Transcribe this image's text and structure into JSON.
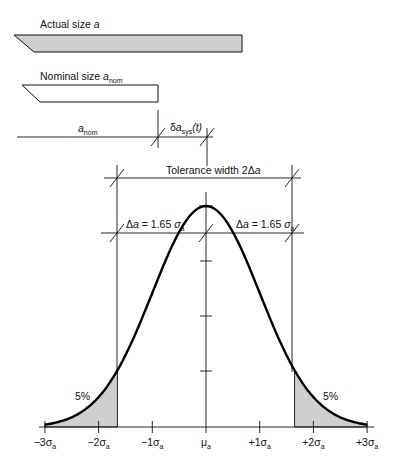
{
  "labels": {
    "actual_size": "Actual size ",
    "actual_size_var": "a",
    "nominal_size": "Nominal size ",
    "nominal_size_var": "a",
    "nominal_size_sub": "nom",
    "a_nom_var": "a",
    "a_nom_sub": "nom",
    "delta_sys_prefix": "δ",
    "delta_sys_var": "a",
    "delta_sys_sub": "sys",
    "delta_sys_suffix": "(t)",
    "tolerance_width": "Tolerance width 2Δ",
    "tolerance_width_var": "a",
    "delta_left_prefix": "Δ",
    "delta_left_var": "a",
    "delta_left_eq": " = 1.65 ",
    "delta_left_sigma": "σ",
    "delta_left_sub": "a",
    "delta_right_prefix": "Δ",
    "delta_right_var": "a",
    "delta_right_eq": " = 1.65 ",
    "delta_right_sigma": "σ",
    "delta_right_sub": "a",
    "tail_left_pct": "5%",
    "tail_right_pct": "5%"
  },
  "axis": {
    "ticks": [
      {
        "main": "−3σ",
        "sub": "a"
      },
      {
        "main": "−2σ",
        "sub": "a"
      },
      {
        "main": "−1σ",
        "sub": "a"
      },
      {
        "main": "μ",
        "sub": "a"
      },
      {
        "main": "+1σ",
        "sub": "a"
      },
      {
        "main": "+2σ",
        "sub": "a"
      },
      {
        "main": "+3σ",
        "sub": "a"
      }
    ]
  },
  "colors": {
    "stroke": "#111111",
    "shade": "#cfcfcf",
    "background": "#ffffff"
  },
  "chart_data": {
    "type": "line",
    "x": [
      -3,
      -2,
      -1,
      0,
      1,
      2,
      3
    ],
    "x_tick_labels": [
      "−3σa",
      "−2σa",
      "−1σa",
      "μa",
      "+1σa",
      "+2σa",
      "+3σa"
    ],
    "tolerance_bounds_sigma": [
      -1.65,
      1.65
    ],
    "tail_areas_percent": {
      "left": 5,
      "right": 5
    },
    "delta_a": "1.65 σa"
  }
}
